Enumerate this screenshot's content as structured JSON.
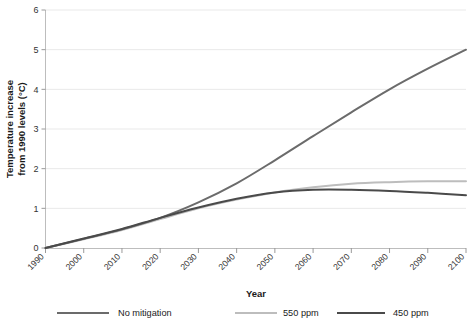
{
  "chart_data": {
    "type": "line",
    "title": "",
    "xlabel": "Year",
    "ylabel": "Temperature increase from 1990 levels (°C)",
    "ylabel_line1": "Temperature increase",
    "ylabel_line2": "from 1990 levels (°C)",
    "xlim": [
      1990,
      2100
    ],
    "ylim": [
      0,
      6
    ],
    "grid": "horizontal",
    "legend_position": "bottom",
    "x": [
      1990,
      2000,
      2010,
      2020,
      2030,
      2040,
      2050,
      2060,
      2070,
      2080,
      2090,
      2100
    ],
    "xticklabels": [
      "1990",
      "2000",
      "2010",
      "2020",
      "2030",
      "2040",
      "2050",
      "2060",
      "2070",
      "2080",
      "2090",
      "2100"
    ],
    "yticks": [
      0,
      1,
      2,
      3,
      4,
      5,
      6
    ],
    "yticklabels": [
      "0",
      "1",
      "2",
      "3",
      "4",
      "5",
      "6"
    ],
    "series": [
      {
        "name": "No mitigation",
        "color": "#6b6b6b",
        "width": 2.0,
        "values": [
          0.0,
          0.23,
          0.47,
          0.76,
          1.15,
          1.63,
          2.21,
          2.82,
          3.42,
          4.0,
          4.52,
          5.0
        ]
      },
      {
        "name": "550 ppm",
        "color": "#bdbdbd",
        "width": 2.0,
        "values": [
          0.0,
          0.22,
          0.45,
          0.73,
          1.0,
          1.22,
          1.4,
          1.53,
          1.62,
          1.66,
          1.68,
          1.68
        ]
      },
      {
        "name": "450 ppm",
        "color": "#4a4a4a",
        "width": 2.0,
        "values": [
          0.0,
          0.24,
          0.48,
          0.76,
          1.02,
          1.24,
          1.4,
          1.47,
          1.47,
          1.44,
          1.39,
          1.33
        ]
      }
    ]
  },
  "legend": {
    "items": [
      {
        "label": "No mitigation",
        "color": "#6b6b6b"
      },
      {
        "label": "550 ppm",
        "color": "#bdbdbd"
      },
      {
        "label": "450 ppm",
        "color": "#4a4a4a"
      }
    ]
  },
  "axes": {
    "x_title": "Year",
    "y_title_line1": "Temperature increase",
    "y_title_line2": "from 1990 levels (°C)"
  },
  "colors": {
    "background": "#ffffff",
    "grid": "#e9e9e9",
    "axis": "#bdbdbd",
    "text": "#333333",
    "no_mitigation": "#6b6b6b",
    "ppm550": "#bdbdbd",
    "ppm450": "#4a4a4a"
  }
}
